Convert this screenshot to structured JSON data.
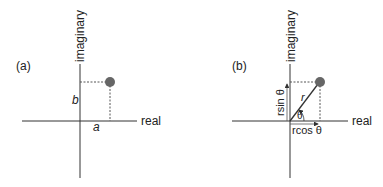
{
  "panels": [
    {
      "label": "(a)",
      "y_axis_label": "imaginary",
      "x_axis_label": "real",
      "real_part_label": "a",
      "imag_part_label": "b"
    },
    {
      "label": "(b)",
      "y_axis_label": "imaginary",
      "x_axis_label": "real",
      "radius_label": "r",
      "angle_label": "θ",
      "x_component_label": "rcos θ",
      "y_component_label": "rsin θ"
    }
  ],
  "colors": {
    "axis": "#333333",
    "point": "#666666"
  }
}
